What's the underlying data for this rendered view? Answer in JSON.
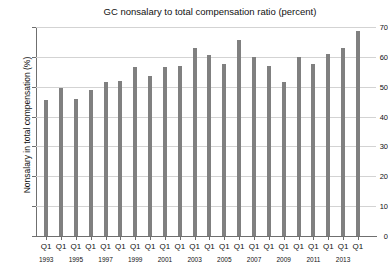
{
  "chart_data": {
    "type": "bar",
    "title": "GC nonsalary to total compensation ratio (percent)",
    "xlabel": "",
    "ylabel": "Nonsalary in total compensation (%)",
    "ylim": [
      0,
      70
    ],
    "yticks": [
      0,
      10,
      20,
      30,
      40,
      50,
      60,
      70
    ],
    "grid": true,
    "legend": null,
    "quarter_label": "Q1",
    "categories": [
      "1993",
      "1994",
      "1995",
      "1996",
      "1997",
      "1998",
      "1999",
      "2000",
      "2001",
      "2002",
      "2003",
      "2004",
      "2005",
      "2006",
      "2007",
      "2008",
      "2009",
      "2010",
      "2011",
      "2012",
      "2013",
      "2014"
    ],
    "year_tick_labels": [
      "1993",
      "1995",
      "1997",
      "1999",
      "2001",
      "2003",
      "2005",
      "2007",
      "2009",
      "2011",
      "2013"
    ],
    "quarter_tick_count": 22,
    "values": [
      45.5,
      49.5,
      46.0,
      49.0,
      51.5,
      52.0,
      56.5,
      53.5,
      56.5,
      57.0,
      63.0,
      60.5,
      57.5,
      65.5,
      60.0,
      57.0,
      51.5,
      60.0,
      57.5,
      61.0,
      63.0,
      68.5
    ],
    "bar_color": "#808080",
    "grid_color": "#d3d3d3",
    "axis_color": "#6f6f6f",
    "background_color": "#ffffff"
  }
}
